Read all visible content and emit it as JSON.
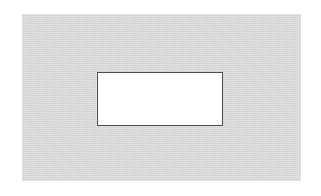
{
  "figure": {
    "canvas": {
      "width_px": 321,
      "height_px": 196,
      "background_color": "#ffffff"
    },
    "outer_panel": {
      "shape": "rectangle",
      "fill_color": "#d2d2d2",
      "x_px": 22,
      "y_px": 14,
      "width_px": 279,
      "height_px": 167,
      "border": "none",
      "texture": "halftone-scan-grain"
    },
    "inner_rect": {
      "shape": "rectangle",
      "fill_color": "#ffffff",
      "border_color": "#4d4d4d",
      "border_width_px": 1.5,
      "x_px": 97,
      "y_px": 72,
      "width_px": 126,
      "height_px": 54,
      "contents": ""
    },
    "artifacts": [
      {
        "name": "speck-a",
        "x_px": 228,
        "y_px": 2,
        "width_px": 14,
        "height_px": 7
      },
      {
        "name": "speck-b",
        "x_px": 252,
        "y_px": 6,
        "width_px": 9,
        "height_px": 5
      },
      {
        "name": "speck-c",
        "x_px": 60,
        "y_px": 186,
        "width_px": 22,
        "height_px": 6
      }
    ],
    "text_content": []
  }
}
